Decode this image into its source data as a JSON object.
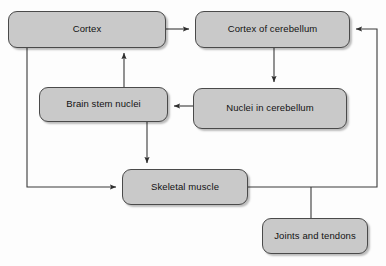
{
  "diagram": {
    "background_color": "#fdfdfd",
    "node_fill_color": "#c9c9c9",
    "node_border_color": "#4a4a4a",
    "connector_color": "#3a3a3a",
    "nodes": [
      {
        "id": "cortex",
        "label": "Cortex"
      },
      {
        "id": "cortex_cereb",
        "label": "Cortex of cerebellum"
      },
      {
        "id": "brainstem",
        "label": "Brain stem nuclei"
      },
      {
        "id": "nuclei_cereb",
        "label": "Nuclei in cerebellum"
      },
      {
        "id": "skeletal",
        "label": "Skeletal muscle"
      },
      {
        "id": "joints",
        "label": "Joints and tendons"
      }
    ],
    "connectors": [
      {
        "from": "cortex",
        "to": "cortex_cereb",
        "arrow": true,
        "direction": "right"
      },
      {
        "from": "cortex_cereb",
        "to": "nuclei_cereb",
        "arrow": true,
        "direction": "down"
      },
      {
        "from": "nuclei_cereb",
        "to": "brainstem",
        "arrow": true,
        "direction": "left"
      },
      {
        "from": "brainstem",
        "to": "cortex",
        "arrow": true,
        "direction": "up"
      },
      {
        "from": "brainstem",
        "to": "skeletal",
        "arrow": true,
        "direction": "down"
      },
      {
        "from": "cortex",
        "to": "skeletal",
        "arrow": true,
        "direction": "down-right"
      },
      {
        "from": "skeletal",
        "to": "cortex_cereb",
        "arrow": true,
        "direction": "right-up-left"
      },
      {
        "from": "skeletal",
        "to": "joints",
        "arrow": false,
        "direction": "down"
      }
    ]
  }
}
